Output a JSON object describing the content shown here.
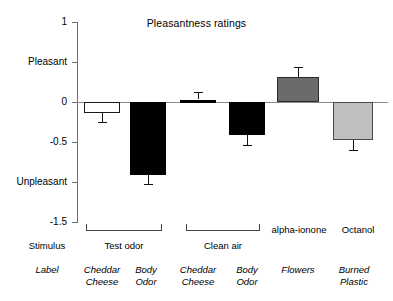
{
  "chart_data": {
    "type": "bar",
    "title": "Pleasantness ratings",
    "xlabel": "",
    "ylabel": "",
    "ylim": [
      -1.5,
      1
    ],
    "grid": false,
    "legend": "none",
    "categories": [
      "Cheddar Cheese",
      "Body Odor",
      "Cheddar Cheese",
      "Body Odor",
      "Flowers",
      "Burned Plastic"
    ],
    "values": [
      -0.14,
      -0.91,
      0.03,
      -0.41,
      0.31,
      -0.48
    ],
    "errors": [
      0.11,
      0.11,
      0.09,
      0.13,
      0.13,
      0.12
    ],
    "bar_styles": [
      "white",
      "black",
      "black",
      "black",
      "dark-gray",
      "light-gray"
    ],
    "y_ticks": [
      {
        "value": 1,
        "label": "1"
      },
      {
        "value": 0.5,
        "label": "Pleasant"
      },
      {
        "value": 0,
        "label": "0"
      },
      {
        "value": -0.5,
        "label": "-0.5"
      },
      {
        "value": -1,
        "label": "Unpleasant"
      },
      {
        "value": -1.5,
        "label": "-1.5"
      }
    ],
    "annotations": {
      "row_headers": [
        "Stimulus",
        "Label"
      ],
      "groups": [
        {
          "label": "Test odor",
          "bracket": true,
          "spans": [
            0,
            1
          ]
        },
        {
          "label": "Clean air",
          "bracket": true,
          "spans": [
            2,
            3
          ]
        },
        {
          "label": "alpha-ionone",
          "bracket": false,
          "spans": [
            4,
            4
          ]
        },
        {
          "label": "Octanol",
          "bracket": false,
          "spans": [
            5,
            5
          ]
        }
      ],
      "labels": [
        {
          "line1": "Cheddar",
          "line2": "Cheese"
        },
        {
          "line1": "Body",
          "line2": "Odor"
        },
        {
          "line1": "Cheddar",
          "line2": "Cheese"
        },
        {
          "line1": "Body",
          "line2": "Odor"
        },
        {
          "line1": "Flowers",
          "line2": ""
        },
        {
          "line1": "Burned",
          "line2": "Plastic"
        }
      ]
    },
    "colors": {
      "white_bar": "#ffffff",
      "black_bar": "#000000",
      "dark_gray_bar": "#6b6b6b",
      "light_gray_bar": "#c0c0c0",
      "axis": "#6e6e6e",
      "zero_line": "#8a8a8a",
      "text": "#000000"
    }
  }
}
